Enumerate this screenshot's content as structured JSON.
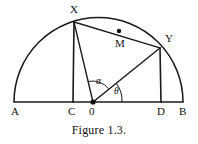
{
  "figure": {
    "caption": "Figure 1.3.",
    "stroke_color": "#1a1a1a",
    "background_color": "#ffffff",
    "points": [
      {
        "id": "A",
        "label": "A",
        "x": 14,
        "y": 102,
        "label_x": 11,
        "label_y": 106,
        "dot": false
      },
      {
        "id": "C",
        "label": "C",
        "x": 72,
        "y": 102,
        "label_x": 68,
        "label_y": 106,
        "dot": false
      },
      {
        "id": "O",
        "label": "0",
        "x": 93,
        "y": 102,
        "label_x": 89,
        "label_y": 106,
        "dot": true
      },
      {
        "id": "D",
        "label": "D",
        "x": 161,
        "y": 102,
        "label_x": 157,
        "label_y": 106,
        "dot": false
      },
      {
        "id": "B",
        "label": "B",
        "x": 183,
        "y": 102,
        "label_x": 179,
        "label_y": 106,
        "dot": false
      },
      {
        "id": "X",
        "label": "X",
        "x": 74,
        "y": 22,
        "label_x": 70,
        "label_y": 4,
        "dot": false
      },
      {
        "id": "Y",
        "label": "Y",
        "x": 160,
        "y": 48,
        "label_x": 165,
        "label_y": 33,
        "dot": false
      },
      {
        "id": "M",
        "label": "M",
        "x": 119,
        "y": 31,
        "label_x": 115,
        "label_y": 38,
        "dot": true
      }
    ],
    "angles": [
      {
        "id": "alpha",
        "label": "α",
        "label_x": 96,
        "label_y": 77,
        "vertex": "O",
        "between": [
          "OX",
          "OY"
        ]
      },
      {
        "id": "theta",
        "label": "θ",
        "label_x": 114,
        "label_y": 87,
        "vertex": "O",
        "between": [
          "OY",
          "OB"
        ]
      }
    ],
    "segments": [
      {
        "id": "diameter-AB",
        "from": "A",
        "to": "B",
        "width": 1.6
      },
      {
        "id": "perp-XC",
        "from": "X",
        "to": "C",
        "width": 1.6
      },
      {
        "id": "perp-YD",
        "from": "Y",
        "to": "D",
        "width": 1.6
      },
      {
        "id": "radius-OX",
        "from": "O",
        "to": "X",
        "width": 1.4
      },
      {
        "id": "radius-OY",
        "from": "O",
        "to": "Y",
        "width": 1.4
      },
      {
        "id": "chord-XY",
        "from": "X",
        "to": "Y",
        "width": 1.4
      }
    ],
    "arc": {
      "id": "semicircle-AB",
      "centre_x": 98.5,
      "centre_y": 102,
      "radius": 84.5,
      "start_angle_deg": 180,
      "end_angle_deg": 0
    }
  }
}
